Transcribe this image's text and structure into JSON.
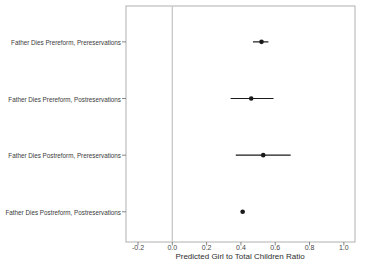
{
  "figure": {
    "background_color": "#ffffff",
    "border_color": "#b0b0b0",
    "reference_line_color": "#c6c6c6",
    "tick_color": "#6a6a6a",
    "point_color": "#1a1a1a",
    "text_color": "#3a3a3a"
  },
  "chart_data": {
    "type": "scatter",
    "subtype": "horizontal-dot-whisker",
    "title": "",
    "xlabel": "Predicted Girl to Total Children Ratio",
    "ylabel": "",
    "xlim": [
      -0.27,
      1.065
    ],
    "xticks": [
      -0.2,
      0.0,
      0.2,
      0.4,
      0.6,
      0.8,
      1.0
    ],
    "xtick_labels": [
      "-0.2",
      "0.0",
      "0.2",
      "0.4",
      "0.6",
      "0.8",
      "1.0"
    ],
    "reference_line_x": 0.0,
    "grid": false,
    "legend": null,
    "categories": [
      "Father Dies Prereform, Prereservations",
      "Father Dies Prereform, Postreservations",
      "Father Dies Postreform, Prereservations",
      "Father Dies Postreform, Postreservations"
    ],
    "points": [
      {
        "estimate": 0.52,
        "ci_low": 0.47,
        "ci_high": 0.56
      },
      {
        "estimate": 0.46,
        "ci_low": 0.34,
        "ci_high": 0.59
      },
      {
        "estimate": 0.53,
        "ci_low": 0.37,
        "ci_high": 0.69
      },
      {
        "estimate": 0.41,
        "ci_low": 0.4,
        "ci_high": 0.42
      }
    ]
  }
}
